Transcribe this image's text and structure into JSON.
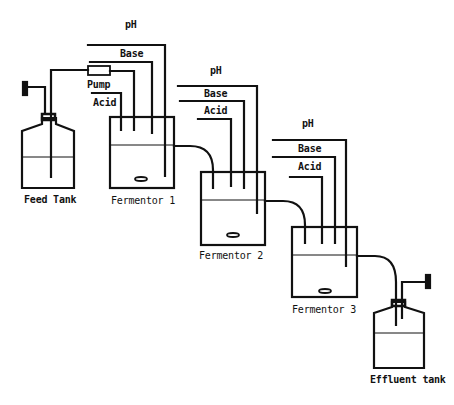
{
  "diagram": {
    "type": "process-flow",
    "stroke_color": "#111111",
    "background": "#ffffff"
  },
  "labels": {
    "feed_tank": "Feed Tank",
    "pump": "Pump",
    "fermentor_1": "Fermentor 1",
    "fermentor_2": "Fermentor 2",
    "fermentor_3": "Fermentor 3",
    "effluent_tank": "Effluent tank",
    "f1": {
      "ph": "pH",
      "base": "Base",
      "acid": "Acid"
    },
    "f2": {
      "ph": "pH",
      "base": "Base",
      "acid": "Acid"
    },
    "f3": {
      "ph": "pH",
      "base": "Base",
      "acid": "Acid"
    }
  },
  "nodes": [
    {
      "id": "feed_tank",
      "label": "Feed Tank"
    },
    {
      "id": "pump",
      "label": "Pump"
    },
    {
      "id": "fermentor_1",
      "label": "Fermentor 1",
      "inputs": [
        "pH",
        "Base",
        "Acid"
      ]
    },
    {
      "id": "fermentor_2",
      "label": "Fermentor 2",
      "inputs": [
        "pH",
        "Base",
        "Acid"
      ]
    },
    {
      "id": "fermentor_3",
      "label": "Fermentor 3",
      "inputs": [
        "pH",
        "Base",
        "Acid"
      ]
    },
    {
      "id": "effluent_tank",
      "label": "Effluent tank"
    }
  ],
  "edges": [
    {
      "from": "feed_tank",
      "to": "pump"
    },
    {
      "from": "pump",
      "to": "fermentor_1"
    },
    {
      "from": "fermentor_1",
      "to": "fermentor_2"
    },
    {
      "from": "fermentor_2",
      "to": "fermentor_3"
    },
    {
      "from": "fermentor_3",
      "to": "effluent_tank"
    }
  ]
}
